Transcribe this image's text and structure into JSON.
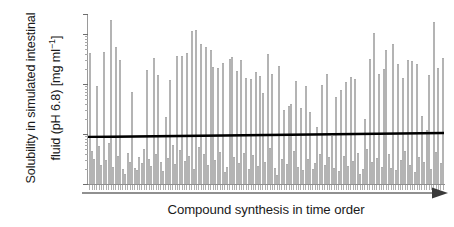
{
  "chart_data": {
    "type": "bar",
    "title": "",
    "subtitle": "",
    "xlabel": "Compound synthesis in time order",
    "ylabel": "Solubility in simulated intestinal fluid (pH 6.8) [mg ml⁻¹]",
    "ylabel_line1": "Solubility in simulated intestinal",
    "ylabel_line2_prefix": "fluid (pH 6.8) [mg ml",
    "ylabel_line2_suffix": "]",
    "ylabel_exponent": "−1",
    "yscale": "log",
    "ylim": [
      1,
      2500
    ],
    "ytick_labels": [
      "2500",
      "1000",
      "100",
      "10",
      "1"
    ],
    "ytick_values": [
      2500,
      1000,
      100,
      10,
      1
    ],
    "grid": false,
    "legend": false,
    "legend_position": "none",
    "bar_color": "#f2f2f2",
    "bar_edge_color": "#b4b4b4",
    "trendline_color": "#000000",
    "axis_color": "#8f8f8f",
    "xaxis_arrow": true,
    "xtick_labels": [],
    "annotations": [
      {
        "text": "horizontal reference / trend line near 10 mg ml⁻¹",
        "value": 10
      }
    ],
    "trendline": {
      "start_value": 9.8,
      "end_value": 11.2,
      "note": "slight upward trend across time order"
    },
    "categories": [
      "1",
      "2",
      "3",
      "4",
      "5",
      "6",
      "7",
      "8",
      "9",
      "10",
      "11",
      "12",
      "13",
      "14",
      "15",
      "16",
      "17",
      "18",
      "19",
      "20",
      "21",
      "22",
      "23",
      "24",
      "25",
      "26",
      "27",
      "28",
      "29",
      "30",
      "31",
      "32",
      "33",
      "34",
      "35",
      "36",
      "37",
      "38",
      "39",
      "40",
      "41",
      "42",
      "43",
      "44",
      "45",
      "46",
      "47",
      "48",
      "49",
      "50",
      "51",
      "52",
      "53",
      "54",
      "55",
      "56",
      "57",
      "58",
      "59",
      "60",
      "61",
      "62",
      "63",
      "64",
      "65",
      "66",
      "67",
      "68",
      "69",
      "70",
      "71",
      "72",
      "73",
      "74",
      "75",
      "76",
      "77",
      "78",
      "79",
      "80",
      "81",
      "82",
      "83",
      "84",
      "85",
      "86",
      "87",
      "88",
      "89",
      "90",
      "91",
      "92",
      "93",
      "94",
      "95",
      "96",
      "97",
      "98",
      "99",
      "100",
      "101",
      "102",
      "103",
      "104",
      "105",
      "106",
      "107",
      "108",
      "109",
      "110",
      "111",
      "112",
      "113",
      "114",
      "115",
      "116",
      "117",
      "118",
      "119",
      "120",
      "121",
      "122",
      "123",
      "124",
      "125",
      "126",
      "127",
      "128",
      "129",
      "130",
      "131",
      "132",
      "133",
      "134",
      "135",
      "136",
      "137",
      "138",
      "139",
      "140",
      "141",
      "142",
      "143",
      "144",
      "145",
      "146",
      "147",
      "148",
      "149",
      "150"
    ],
    "values": [
      420,
      4.5,
      3.2,
      90,
      5.8,
      2.4,
      430,
      3.0,
      6.5,
      1900,
      2.2,
      540,
      3.6,
      300,
      2.0,
      1.6,
      4.2,
      2.8,
      70,
      2.1,
      1.9,
      3.4,
      2.6,
      5.0,
      190,
      3.1,
      2.3,
      330,
      4.0,
      150,
      2.7,
      1.8,
      22,
      3.3,
      120,
      6.0,
      2.5,
      370,
      4.8,
      360,
      2.9,
      410,
      3.7,
      1150,
      2.0,
      1200,
      5.5,
      620,
      3.9,
      560,
      2.4,
      480,
      220,
      3.0,
      210,
      4.4,
      260,
      1.7,
      2.2,
      320,
      340,
      3.5,
      180,
      2.6,
      300,
      4.1,
      130,
      2.0,
      125,
      3.8,
      170,
      2.3,
      145,
      65,
      2.8,
      400,
      5.2,
      160,
      2.1,
      1.5,
      230,
      3.2,
      30,
      2.5,
      36,
      40,
      4.6,
      115,
      2.2,
      33,
      1.9,
      90,
      3.1,
      28,
      2.0,
      2.6,
      14,
      4.0,
      95,
      2.4,
      160,
      3.4,
      9.0,
      2.1,
      55,
      1.8,
      75,
      3.6,
      110,
      2.3,
      135,
      2.9,
      125,
      4.2,
      1.6,
      2.0,
      20,
      5.0,
      310,
      2.7,
      1050,
      3.3,
      160,
      2.2,
      200,
      480,
      3.9,
      2.1,
      620,
      1.9,
      255,
      3.0,
      130,
      4.5,
      300,
      2.4,
      290,
      1.7,
      250,
      3.5,
      23,
      2.8,
      12,
      150,
      2.0,
      1700,
      4.3,
      210,
      2.6,
      330
    ]
  }
}
